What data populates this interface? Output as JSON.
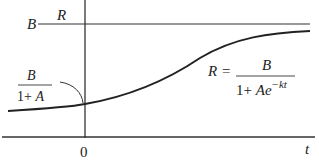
{
  "diagram": {
    "type": "logistic-growth-curve",
    "axes": {
      "y_label": "R",
      "x_label": "t",
      "origin_label": "0"
    },
    "asymptote": {
      "label": "B"
    },
    "intercept": {
      "numerator": "B",
      "denominator": "1+ A"
    },
    "equation": {
      "lhs": "R =",
      "numerator": "B",
      "denominator_base": "1+ Ae",
      "denominator_exponent": "−kt"
    },
    "colors": {
      "stroke": "#222222",
      "background": "#ffffff"
    }
  }
}
